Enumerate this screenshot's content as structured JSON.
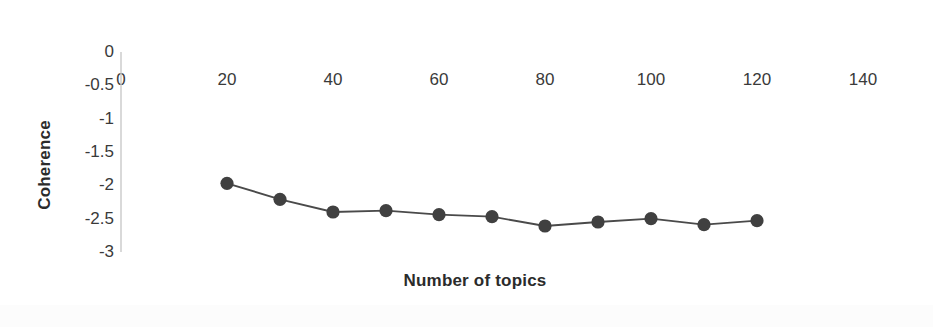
{
  "chart_data": {
    "type": "line",
    "title": "",
    "xlabel": "Number of topics",
    "ylabel": "Coherence",
    "x": [
      20,
      30,
      40,
      50,
      60,
      70,
      80,
      90,
      100,
      110,
      120
    ],
    "values": [
      -1.97,
      -2.21,
      -2.4,
      -2.38,
      -2.44,
      -2.47,
      -2.61,
      -2.55,
      -2.5,
      -2.59,
      -2.53
    ],
    "series": [
      {
        "name": "Coherence",
        "values": [
          -1.97,
          -2.21,
          -2.4,
          -2.38,
          -2.44,
          -2.47,
          -2.61,
          -2.55,
          -2.5,
          -2.59,
          -2.53
        ]
      }
    ],
    "xlim": [
      0,
      148
    ],
    "ylim": [
      -3,
      0
    ],
    "xticks": [
      0,
      20,
      40,
      60,
      80,
      100,
      120,
      140
    ],
    "xtick_labels": [
      "0",
      "20",
      "40",
      "60",
      "80",
      "100",
      "120",
      "140"
    ],
    "yticks": [
      0,
      -0.5,
      -1,
      -1.5,
      -2,
      -2.5,
      -3
    ],
    "ytick_labels": [
      "0",
      "-0.5",
      "-1",
      "-1.5",
      "-2",
      "-2.5",
      "-3"
    ],
    "grid": false,
    "legend": false,
    "legend_position": "none",
    "marker": "circle",
    "marker_color": "#404040",
    "line_color": "#4a4a4a",
    "axis_color": "#c9c9c9",
    "background_color": "#ffffff"
  }
}
